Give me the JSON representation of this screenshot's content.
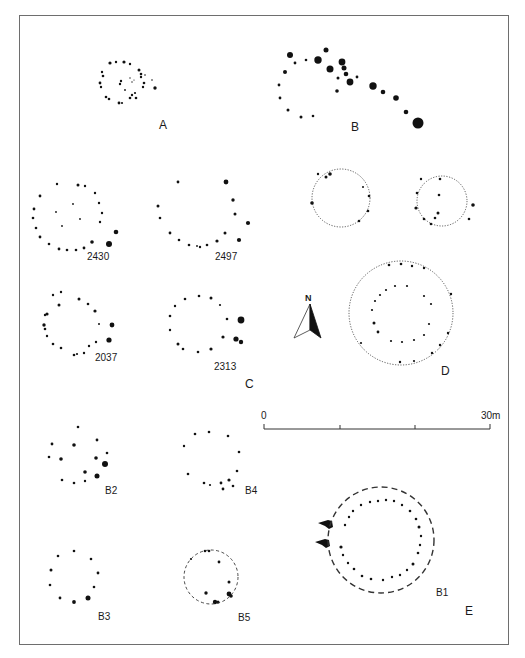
{
  "figure": {
    "panels": [
      {
        "id": "A",
        "label": "A",
        "label_pos": [
          162,
          126
        ]
      },
      {
        "id": "B",
        "label": "B",
        "label_pos": [
          351,
          126
        ]
      },
      {
        "id": "C",
        "label": "C",
        "label_pos": [
          246,
          391
        ]
      },
      {
        "id": "D",
        "label": "D",
        "label_pos": [
          443,
          372
        ]
      },
      {
        "id": "E",
        "label": "E",
        "label_pos": [
          466,
          600
        ]
      }
    ],
    "plans": [
      {
        "id": "2430",
        "label": "2430",
        "label_pos": [
          87,
          257
        ]
      },
      {
        "id": "2497",
        "label": "2497",
        "label_pos": [
          215,
          257
        ]
      },
      {
        "id": "2037",
        "label": "2037",
        "label_pos": [
          95,
          360
        ]
      },
      {
        "id": "2313",
        "label": "2313",
        "label_pos": [
          214,
          368
        ]
      },
      {
        "id": "B2",
        "label": "B2",
        "label_pos": [
          106,
          487
        ]
      },
      {
        "id": "B4",
        "label": "B4",
        "label_pos": [
          250,
          487
        ]
      },
      {
        "id": "B3",
        "label": "B3",
        "label_pos": [
          99,
          612
        ]
      },
      {
        "id": "B5",
        "label": "B5",
        "label_pos": [
          238,
          613
        ]
      },
      {
        "id": "B1",
        "label": "B1",
        "label_pos": [
          436,
          585
        ]
      }
    ],
    "north_arrow": {
      "label": "N"
    },
    "scale_bar": {
      "start_label": "0",
      "end_label": "30m",
      "ticks": 4
    },
    "colors": {
      "ink": "#111111",
      "frame": "#6e6e6e",
      "background": "#ffffff"
    }
  }
}
